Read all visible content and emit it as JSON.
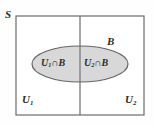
{
  "figure": {
    "type": "venn-partition-diagram",
    "background_color": "#fefefe",
    "line_color": "#555555",
    "text_color": "#2b2b2b"
  },
  "sample_space": {
    "label": "S",
    "name": "sample-space",
    "border_color": "#6b6b6b",
    "rect": {
      "x": 16,
      "y": 16,
      "width": 128,
      "height": 99
    }
  },
  "partitions": [
    {
      "id": "u1",
      "label": "U",
      "subscript": "1",
      "name": "partition-u1",
      "position": "left"
    },
    {
      "id": "u2",
      "label": "U",
      "subscript": "2",
      "name": "partition-u2",
      "position": "right"
    }
  ],
  "divider": {
    "name": "partition-divider",
    "x": 80,
    "y1": 16,
    "y2": 115,
    "color": "#6b6b6b"
  },
  "event": {
    "id": "b",
    "label": "B",
    "name": "event-b",
    "fill_color": "#d8d8d8",
    "stroke_color": "#666666",
    "ellipse": {
      "cx": 80,
      "cy": 64,
      "rx": 48,
      "ry": 18
    }
  },
  "intersections": [
    {
      "id": "u1-cap-b",
      "prefix": "U",
      "subscript": "1",
      "operator": "∩",
      "suffix": "B",
      "name": "intersection-u1-b"
    },
    {
      "id": "u2-cap-b",
      "prefix": "U",
      "subscript": "2",
      "operator": "∩",
      "suffix": "B",
      "name": "intersection-u2-b"
    }
  ]
}
